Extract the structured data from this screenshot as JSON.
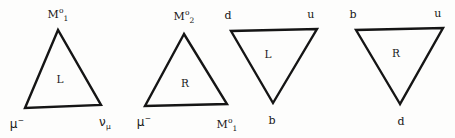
{
  "figure": {
    "background_color": "#fdfdfc",
    "line_color": "#151515",
    "text_color": "#161616",
    "width": 455,
    "height": 138
  },
  "triangles": [
    {
      "name": "triangle-1",
      "orientation": "up",
      "interior_label": "L",
      "interior_x": 60,
      "interior_y": 79,
      "apex": {
        "x": 58,
        "y": 30
      },
      "left": {
        "x": 25,
        "y": 108
      },
      "right": {
        "x": 101,
        "y": 105
      },
      "vertex_labels": [
        {
          "name": "vertex-label-apex",
          "base": "M",
          "sup": "o",
          "sub": "1",
          "x": 58,
          "y": 14
        },
        {
          "name": "vertex-label-left",
          "base": "μ",
          "sup": "−",
          "sub": "",
          "x": 17,
          "y": 124,
          "greek": true
        },
        {
          "name": "vertex-label-right",
          "base": "ν",
          "sup": "",
          "sub": "μ",
          "x": 105,
          "y": 122,
          "greek": true
        }
      ]
    },
    {
      "name": "triangle-2",
      "orientation": "up",
      "interior_label": "R",
      "interior_x": 185,
      "interior_y": 83,
      "apex": {
        "x": 184,
        "y": 34
      },
      "left": {
        "x": 145,
        "y": 106
      },
      "right": {
        "x": 227,
        "y": 104
      },
      "vertex_labels": [
        {
          "name": "vertex-label-apex",
          "base": "M",
          "sup": "o",
          "sub": "2",
          "x": 184,
          "y": 16
        },
        {
          "name": "vertex-label-left",
          "base": "μ",
          "sup": "−",
          "sub": "",
          "x": 144,
          "y": 122,
          "greek": true
        },
        {
          "name": "vertex-label-right",
          "base": "M",
          "sup": "o",
          "sub": "1",
          "x": 227,
          "y": 124
        }
      ]
    },
    {
      "name": "triangle-3",
      "orientation": "down",
      "interior_label": "L",
      "interior_x": 268,
      "interior_y": 54,
      "apex": {
        "x": 273,
        "y": 103
      },
      "left": {
        "x": 231,
        "y": 31
      },
      "right": {
        "x": 317,
        "y": 29
      },
      "vertex_labels": [
        {
          "name": "vertex-label-left",
          "base": "d",
          "sup": "",
          "sub": "",
          "x": 228,
          "y": 15
        },
        {
          "name": "vertex-label-right",
          "base": "u",
          "sup": "",
          "sub": "",
          "x": 311,
          "y": 14
        },
        {
          "name": "vertex-label-apex",
          "base": "b",
          "sup": "",
          "sub": "",
          "x": 272,
          "y": 120
        }
      ]
    },
    {
      "name": "triangle-4",
      "orientation": "down",
      "interior_label": "R",
      "interior_x": 396,
      "interior_y": 53,
      "apex": {
        "x": 400,
        "y": 104
      },
      "left": {
        "x": 356,
        "y": 30
      },
      "right": {
        "x": 443,
        "y": 28
      },
      "vertex_labels": [
        {
          "name": "vertex-label-left",
          "base": "b",
          "sup": "",
          "sub": "",
          "x": 353,
          "y": 14
        },
        {
          "name": "vertex-label-right",
          "base": "u",
          "sup": "",
          "sub": "",
          "x": 438,
          "y": 13
        },
        {
          "name": "vertex-label-apex",
          "base": "d",
          "sup": "",
          "sub": "",
          "x": 401,
          "y": 121
        }
      ]
    }
  ]
}
